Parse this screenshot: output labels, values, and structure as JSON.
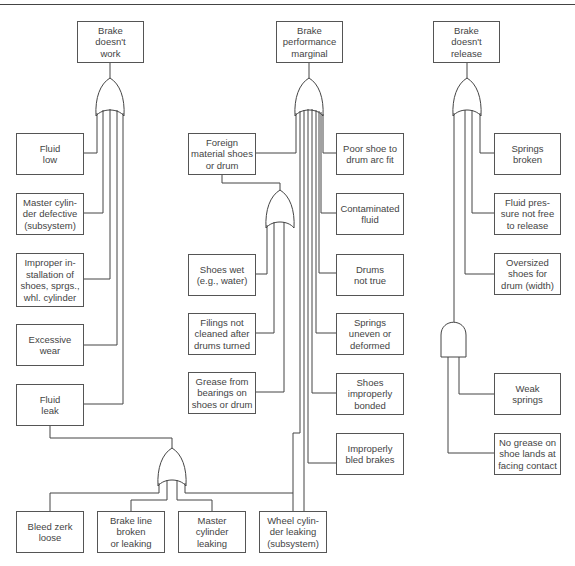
{
  "trees": [
    {
      "top_event": "Brake\ndoesn't\nwork",
      "gate": "OR",
      "events": [
        "Fluid\nlow",
        "Master cylin-\nder defective\n(subsystem)",
        "Improper in-\nstallation of\nshoes, sprgs.,\nwhl. cylinder",
        "Excessive\nwear",
        "Fluid\nleak"
      ],
      "sub_tree": {
        "parent": "Fluid\nleak",
        "gate": "OR",
        "events": [
          "Bleed zerk\nloose",
          "Brake line\nbroken\nor leaking",
          "Master\ncylinder\nleaking",
          "Wheel cylin-\nder leaking\n(subsystem)"
        ]
      }
    },
    {
      "top_event": "Brake\nperformance\nmarginal",
      "gate": "OR",
      "events": [
        "Foreign\nmaterial shoes\nor drum",
        "Poor shoe to\ndrum arc fit",
        "Contaminated\nfluid",
        "Drums\nnot true",
        "Springs\nuneven or\ndeformed",
        "Shoes\nimproperly\nbonded",
        "Improperly\nbled brakes"
      ],
      "sub_tree": {
        "parent": "Foreign\nmaterial shoes\nor drum",
        "gate": "OR",
        "events": [
          "Shoes wet\n(e.g., water)",
          "Filings not\ncleaned after\ndrums turned",
          "Grease from\nbearings on\nshoes or drum"
        ]
      }
    },
    {
      "top_event": "Brake\ndoesn't\nrelease",
      "gate": "OR",
      "events": [
        "Springs\nbroken",
        "Fluid pres-\nsure not free\nto release",
        "Oversized\nshoes for\ndrum (width)"
      ],
      "sub_tree": {
        "gate": "AND",
        "events": [
          "Weak\nsprings",
          "No grease on\nshoe lands at\nfacing contact"
        ]
      }
    }
  ]
}
